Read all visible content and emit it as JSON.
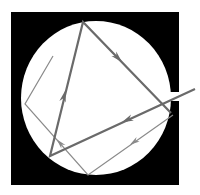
{
  "diagram": {
    "colors": {
      "background": "#ffffff",
      "enclosure": "#000000",
      "cavity": "#ffffff",
      "thick_ray": "#6a6a6a",
      "thin_ray": "#8a8a8a"
    },
    "enclosure": {
      "x": 11,
      "y": 12,
      "width": 168,
      "height": 173
    },
    "cavity": {
      "cx": 96,
      "cy": 98,
      "rx": 75,
      "ry": 77
    },
    "opening": {
      "x": 170,
      "y": 92,
      "width": 10,
      "height": 9
    },
    "thick_ray": {
      "points": [
        [
          195,
          89
        ],
        [
          50,
          156
        ],
        [
          83,
          22
        ],
        [
          171,
          113
        ]
      ],
      "arrows": [
        {
          "x": 127,
          "y": 120,
          "angle": 155
        },
        {
          "x": 64,
          "y": 96,
          "angle": -76
        },
        {
          "x": 118,
          "y": 58,
          "angle": 46
        }
      ]
    },
    "thin_ray": {
      "points": [
        [
          53,
          56
        ],
        [
          25,
          104
        ],
        [
          88,
          175
        ],
        [
          173,
          115
        ]
      ],
      "arrows": [
        {
          "x": 134,
          "y": 142,
          "angle": 145
        },
        {
          "x": 60,
          "y": 143,
          "angle": -132
        }
      ]
    }
  }
}
